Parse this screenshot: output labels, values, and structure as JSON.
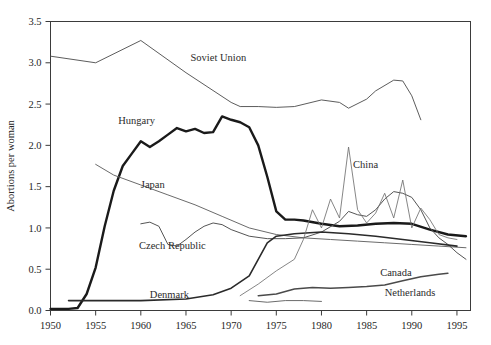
{
  "figure": {
    "title": "",
    "ylabel": "Abortions per woman",
    "xlabel": ""
  },
  "axes": {
    "x_ticks": [
      "1950",
      "1955",
      "1960",
      "1965",
      "1970",
      "1975",
      "1980",
      "1985",
      "1990",
      "1995"
    ],
    "y_ticks": [
      "0.0",
      "0.5",
      "1.0",
      "1.5",
      "2.0",
      "2.5",
      "3.0",
      "3.5"
    ],
    "xlim": [
      1950,
      1996.5
    ],
    "ylim": [
      0,
      3.5
    ],
    "grid": false
  },
  "labels": {
    "soviet_union": "Soviet Union",
    "hungary": "Hungary",
    "japan": "Japan",
    "czech_republic": "Czech Republic",
    "denmark": "Denmark",
    "china": "China",
    "canada": "Canada",
    "netherlands": "Netherlands"
  },
  "colors": {
    "axis": "#3b3b3b",
    "text": "#262626",
    "soviet_union": "#4a4a4a",
    "hungary": "#1a1a1a",
    "japan": "#6b6b6b",
    "czech_republic": "#555555",
    "denmark": "#2a2a2a",
    "china": "#707070",
    "canada": "#4a4a4a",
    "netherlands": "#5a5a5a"
  },
  "chart_data": {
    "type": "line",
    "title": "",
    "xlabel": "",
    "ylabel": "Abortions per woman",
    "xlim": [
      1950,
      1996.5
    ],
    "ylim": [
      0,
      3.5
    ],
    "grid": false,
    "legend": "inline-annotations",
    "series": [
      {
        "name": "Soviet Union",
        "x": [
          1950,
          1955,
          1960,
          1965,
          1970,
          1971,
          1973,
          1975,
          1977,
          1980,
          1982,
          1983,
          1985,
          1986,
          1988,
          1989,
          1990,
          1991
        ],
        "values": [
          3.08,
          3.0,
          3.27,
          2.88,
          2.52,
          2.47,
          2.47,
          2.46,
          2.47,
          2.55,
          2.52,
          2.45,
          2.56,
          2.66,
          2.79,
          2.78,
          2.6,
          2.31
        ]
      },
      {
        "name": "Hungary",
        "x": [
          1950,
          1952,
          1953,
          1954,
          1955,
          1956,
          1957,
          1958,
          1959,
          1960,
          1961,
          1962,
          1963,
          1964,
          1965,
          1966,
          1967,
          1968,
          1969,
          1970,
          1971,
          1972,
          1973,
          1974,
          1975,
          1976,
          1977,
          1978,
          1980,
          1982,
          1984,
          1986,
          1988,
          1990,
          1992,
          1994,
          1996
        ],
        "values": [
          0.02,
          0.02,
          0.03,
          0.2,
          0.52,
          1.02,
          1.45,
          1.75,
          1.9,
          2.05,
          1.98,
          2.05,
          2.13,
          2.21,
          2.17,
          2.2,
          2.15,
          2.16,
          2.35,
          2.31,
          2.28,
          2.22,
          2.0,
          1.62,
          1.2,
          1.1,
          1.1,
          1.09,
          1.05,
          1.02,
          1.03,
          1.05,
          1.06,
          1.05,
          0.98,
          0.92,
          0.9
        ]
      },
      {
        "name": "Japan",
        "x": [
          1955,
          1957,
          1960,
          1963,
          1966,
          1969,
          1972,
          1975,
          1978,
          1981,
          1984,
          1987,
          1990,
          1993,
          1996
        ],
        "values": [
          1.77,
          1.64,
          1.52,
          1.4,
          1.28,
          1.14,
          1.0,
          0.92,
          0.88,
          0.86,
          0.84,
          0.82,
          0.8,
          0.78,
          0.76
        ]
      },
      {
        "name": "Czech Republic",
        "x": [
          1960,
          1961,
          1962,
          1963,
          1964,
          1965,
          1966,
          1967,
          1968,
          1969,
          1970,
          1972,
          1974,
          1976,
          1978,
          1980,
          1982,
          1983,
          1984,
          1985,
          1986,
          1987,
          1988,
          1989,
          1990,
          1991,
          1992,
          1993,
          1994,
          1995,
          1996
        ],
        "values": [
          1.05,
          1.07,
          1.02,
          0.8,
          0.78,
          0.86,
          0.95,
          1.02,
          1.06,
          1.04,
          0.98,
          0.9,
          0.87,
          0.87,
          0.88,
          0.95,
          1.08,
          1.2,
          1.16,
          1.14,
          1.22,
          1.35,
          1.44,
          1.42,
          1.37,
          1.22,
          1.0,
          0.88,
          0.8,
          0.7,
          0.62
        ]
      },
      {
        "name": "Denmark",
        "x": [
          1952,
          1955,
          1960,
          1965,
          1968,
          1970,
          1972,
          1973,
          1974,
          1975,
          1977,
          1980,
          1983,
          1986,
          1989,
          1992,
          1995
        ],
        "values": [
          0.12,
          0.12,
          0.12,
          0.14,
          0.19,
          0.27,
          0.42,
          0.62,
          0.82,
          0.9,
          0.93,
          0.95,
          0.93,
          0.9,
          0.86,
          0.82,
          0.78
        ]
      },
      {
        "name": "China",
        "x": [
          1971,
          1973,
          1975,
          1977,
          1978,
          1979,
          1980,
          1981,
          1982,
          1983,
          1984,
          1985,
          1986,
          1987,
          1988,
          1989,
          1990,
          1991,
          1992,
          1993,
          1994,
          1995
        ],
        "values": [
          0.18,
          0.32,
          0.48,
          0.62,
          0.86,
          1.22,
          1.0,
          1.35,
          1.12,
          1.98,
          1.22,
          1.06,
          1.18,
          1.42,
          1.12,
          1.58,
          1.0,
          1.24,
          1.1,
          0.92,
          0.88,
          0.86
        ]
      },
      {
        "name": "Canada",
        "x": [
          1973,
          1975,
          1977,
          1979,
          1981,
          1983,
          1985,
          1987,
          1989,
          1991,
          1993,
          1994
        ],
        "values": [
          0.18,
          0.2,
          0.26,
          0.28,
          0.27,
          0.28,
          0.29,
          0.31,
          0.36,
          0.41,
          0.44,
          0.45
        ]
      },
      {
        "name": "Netherlands",
        "x": [
          1972,
          1974,
          1976,
          1978,
          1980
        ],
        "values": [
          0.12,
          0.1,
          0.12,
          0.12,
          0.11
        ]
      }
    ]
  },
  "annotations": [
    {
      "text": "Soviet Union",
      "x": 1965.5,
      "y": 3.02
    },
    {
      "text": "Hungary",
      "x": 1957.5,
      "y": 2.26
    },
    {
      "text": "Japan",
      "x": 1960.0,
      "y": 1.48
    },
    {
      "text": "Czech Republic",
      "x": 1959.8,
      "y": 0.74
    },
    {
      "text": "Denmark",
      "x": 1961.0,
      "y": 0.15
    },
    {
      "text": "China",
      "x": 1983.5,
      "y": 1.72
    },
    {
      "text": "Canada",
      "x": 1986.5,
      "y": 0.42
    },
    {
      "text": "Netherlands",
      "x": 1987.0,
      "y": 0.17
    }
  ]
}
